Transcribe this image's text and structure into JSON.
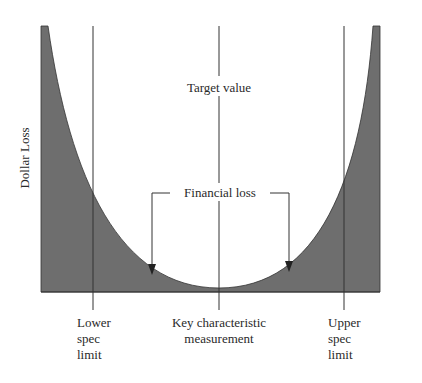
{
  "diagram": {
    "y_axis_label": "Dollar Loss",
    "target_label": "Target value",
    "financial_loss_label": "Financial loss",
    "x_labels": {
      "lower": [
        "Lower",
        "spec",
        "limit"
      ],
      "center": [
        "Key characteristic",
        "measurement"
      ],
      "upper": [
        "Upper",
        "spec",
        "limit"
      ]
    },
    "colors": {
      "loss_fill": "#6e6e6e",
      "line": "#333333",
      "background": "#ffffff"
    }
  }
}
